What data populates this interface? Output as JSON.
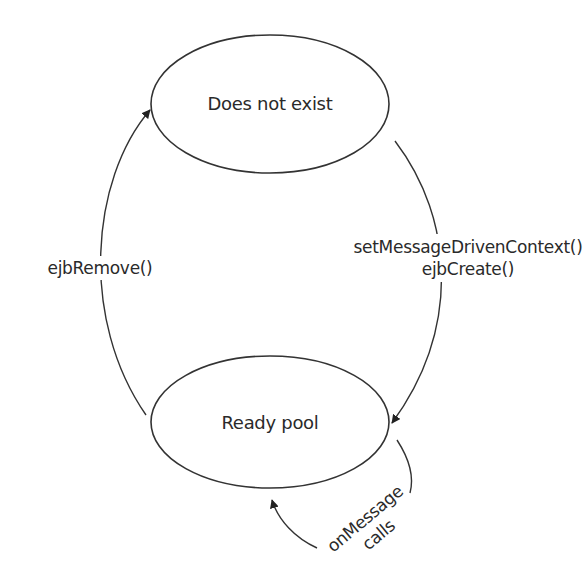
{
  "diagram": {
    "type": "state-diagram",
    "states": [
      {
        "id": "does-not-exist",
        "label": "Does not exist"
      },
      {
        "id": "ready-pool",
        "label": "Ready pool"
      }
    ],
    "transitions": [
      {
        "from": "ready-pool",
        "to": "does-not-exist",
        "label": "ejbRemove()"
      },
      {
        "from": "does-not-exist",
        "to": "ready-pool",
        "label_lines": [
          "setMessageDrivenContext()",
          "ejbCreate()"
        ]
      },
      {
        "from": "ready-pool",
        "to": "ready-pool",
        "label_lines": [
          "onMessage",
          "calls"
        ]
      }
    ],
    "colors": {
      "stroke": "#333333",
      "text": "#2a2a2a",
      "background": "#ffffff"
    }
  }
}
